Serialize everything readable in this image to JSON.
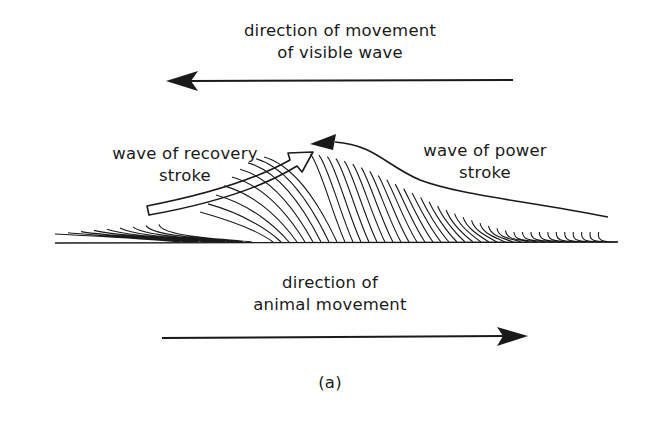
{
  "diagram": {
    "top_label_line1": "direction of movement",
    "top_label_line2": "of visible wave",
    "recovery_label_line1": "wave of recovery",
    "recovery_label_line2": "stroke",
    "power_label_line1": "wave of power",
    "power_label_line2": "stroke",
    "bottom_label_line1": "direction of",
    "bottom_label_line2": "animal movement",
    "caption": "(a)",
    "colors": {
      "ink": "#1a1a1a",
      "background": "#ffffff"
    }
  }
}
